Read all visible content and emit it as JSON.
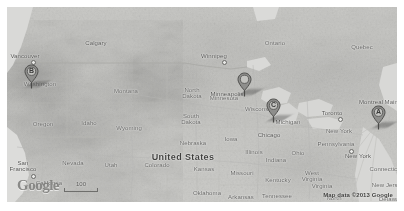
{
  "map": {
    "provider": "Google Maps",
    "style": "grayscale-terrain",
    "attribution": "Map data ©2013 Google",
    "logo_text": "Google",
    "scale": {
      "label": "100",
      "unit": ""
    },
    "region_label": "United States"
  },
  "markers": [
    {
      "id": "A",
      "label": "A",
      "near": "New York",
      "x": 371,
      "y": 116
    },
    {
      "id": "B",
      "label": "B",
      "near": "Washington",
      "x": 24,
      "y": 75
    },
    {
      "id": "C",
      "label": "C",
      "near": "Chicago",
      "x": 266,
      "y": 109
    },
    {
      "id": "D",
      "label": "",
      "near": "Minneapolis",
      "x": 237,
      "y": 83
    }
  ],
  "labels": {
    "country": [
      {
        "text": "United States",
        "x": 176,
        "y": 146
      }
    ],
    "provinces": [
      {
        "text": "Ontario",
        "x": 268,
        "y": 33
      },
      {
        "text": "Quebec",
        "x": 355,
        "y": 37
      }
    ],
    "states": [
      {
        "text": "Washington",
        "x": 33,
        "y": 74
      },
      {
        "text": "Oregon",
        "x": 36,
        "y": 114
      },
      {
        "text": "Montana",
        "x": 119,
        "y": 81
      },
      {
        "text": "Idaho",
        "x": 82,
        "y": 113
      },
      {
        "text": "Wyoming",
        "x": 122,
        "y": 118
      },
      {
        "text": "Nevada",
        "x": 66,
        "y": 153
      },
      {
        "text": "Utah",
        "x": 104,
        "y": 155
      },
      {
        "text": "California",
        "x": 42,
        "y": 173
      },
      {
        "text": "Colorado",
        "x": 150,
        "y": 155
      },
      {
        "text": "North\nDakota",
        "x": 185,
        "y": 80
      },
      {
        "text": "South\nDakota",
        "x": 184,
        "y": 106
      },
      {
        "text": "Nebraska",
        "x": 186,
        "y": 133
      },
      {
        "text": "Kansas",
        "x": 197,
        "y": 159
      },
      {
        "text": "Oklahoma",
        "x": 200,
        "y": 183
      },
      {
        "text": "Minnesota",
        "x": 217,
        "y": 88
      },
      {
        "text": "Iowa",
        "x": 224,
        "y": 129
      },
      {
        "text": "Missouri",
        "x": 235,
        "y": 163
      },
      {
        "text": "Arkansas",
        "x": 234,
        "y": 187
      },
      {
        "text": "Wisconsin",
        "x": 252,
        "y": 99
      },
      {
        "text": "Illinois",
        "x": 247,
        "y": 142
      },
      {
        "text": "Michigan",
        "x": 281,
        "y": 112
      },
      {
        "text": "Indiana",
        "x": 269,
        "y": 150
      },
      {
        "text": "Ohio",
        "x": 291,
        "y": 143
      },
      {
        "text": "Kentucky",
        "x": 271,
        "y": 170
      },
      {
        "text": "Tennessee",
        "x": 270,
        "y": 186
      },
      {
        "text": "West\nVirginia",
        "x": 305,
        "y": 163
      },
      {
        "text": "Virginia",
        "x": 315,
        "y": 176
      },
      {
        "text": "Pennsylvania",
        "x": 329,
        "y": 134
      },
      {
        "text": "North\nCarolina",
        "x": 327,
        "y": 188
      },
      {
        "text": "New York",
        "x": 332,
        "y": 121
      },
      {
        "text": "Maine",
        "x": 386,
        "y": 92
      },
      {
        "text": "Connecticut",
        "x": 379,
        "y": 159
      },
      {
        "text": "New Jersey",
        "x": 381,
        "y": 175
      },
      {
        "text": "Delaware",
        "x": 385,
        "y": 189
      }
    ],
    "cities": [
      {
        "text": "Vancouver",
        "x": 18,
        "y": 46,
        "dot": true,
        "dotdx": 6,
        "dotdy": 7
      },
      {
        "text": "Calgary",
        "x": 89,
        "y": 33,
        "dot": false
      },
      {
        "text": "Winnipeg",
        "x": 207,
        "y": 46,
        "dot": true,
        "dotdx": 8,
        "dotdy": 7
      },
      {
        "text": "Minneapolis",
        "x": 220,
        "y": 84,
        "dot": false
      },
      {
        "text": "Chicago",
        "x": 262,
        "y": 125,
        "dot": false
      },
      {
        "text": "Toronto",
        "x": 325,
        "y": 103,
        "dot": true,
        "dotdx": 6,
        "dotdy": 7
      },
      {
        "text": "Montreal",
        "x": 364,
        "y": 92,
        "dot": true,
        "dotdx": 7,
        "dotdy": 7
      },
      {
        "text": "New York",
        "x": 351,
        "y": 146,
        "dot": true,
        "dotdx": -9,
        "dotdy": -4
      },
      {
        "text": "San\nFrancisco",
        "x": 16,
        "y": 153,
        "dot": true,
        "dotdx": 8,
        "dotdy": 14
      }
    ]
  }
}
